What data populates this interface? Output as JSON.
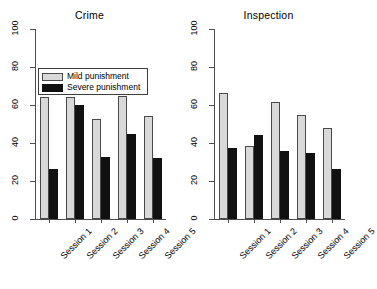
{
  "chart_data": {
    "type": "bar",
    "title": "",
    "categories": [
      "Session 1",
      "Session 2",
      "Session 3",
      "Session 4",
      "Session 5"
    ],
    "xlabel": "",
    "ylabel": "",
    "ylim": [
      0,
      100
    ],
    "yticks": [
      0,
      20,
      40,
      60,
      80,
      100
    ],
    "ytick_labels": [
      "0",
      "20",
      "40",
      "60",
      "80",
      "100"
    ],
    "grid": false,
    "legend": {
      "position": "top-left (panel 1)",
      "entries": [
        {
          "label": "Mild punishment",
          "color": "#d9d9d9",
          "key": "mild"
        },
        {
          "label": "Severe punishment",
          "color": "#111111",
          "key": "severe"
        }
      ]
    },
    "panels": [
      {
        "title": "Crime",
        "series": [
          {
            "name": "Mild punishment",
            "color": "#d9d9d9",
            "values": [
              64,
              64,
              52.5,
              64.5,
              54
            ]
          },
          {
            "name": "Severe punishment",
            "color": "#111111",
            "values": [
              26.5,
              60,
              32.5,
              44.5,
              32
            ]
          }
        ]
      },
      {
        "title": "Inspection",
        "series": [
          {
            "name": "Mild punishment",
            "color": "#d9d9d9",
            "values": [
              66.5,
              38.5,
              61.5,
              54.5,
              48
            ]
          },
          {
            "name": "Severe punishment",
            "color": "#111111",
            "values": [
              37.5,
              44,
              36,
              34.5,
              26.5
            ]
          }
        ]
      }
    ]
  },
  "figure": {
    "background": "#ffffff",
    "axis_color": "#4d4d4d"
  }
}
